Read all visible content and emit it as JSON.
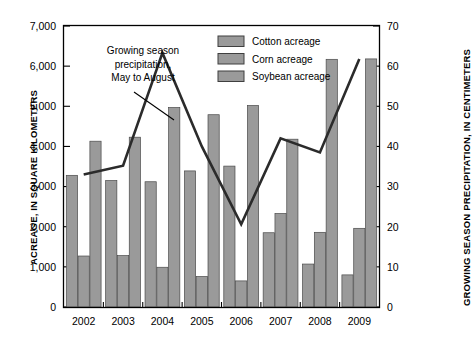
{
  "chart_data": {
    "type": "bar",
    "title": "",
    "categories": [
      "2002",
      "2003",
      "2004",
      "2005",
      "2006",
      "2007",
      "2008",
      "2009"
    ],
    "xlabel": "",
    "ylabel": "ACREAGE, IN SQUARE KILOMETERS",
    "ylabel_right": "GROWING SEASON PRECIPITATION, IN CENTIMETERS",
    "ylim": [
      0,
      7000
    ],
    "ylim_right": [
      0,
      70
    ],
    "yticks": [
      "0",
      "1,000",
      "2,000",
      "3,000",
      "4,000",
      "5,000",
      "6,000",
      "7,000"
    ],
    "yticks_right": [
      "0",
      "10",
      "20",
      "30",
      "40",
      "50",
      "60",
      "70"
    ],
    "grid": false,
    "legend_position": "top-center-right",
    "series": [
      {
        "name": "Cotton acreage",
        "type": "bar",
        "axis": "left",
        "color": "#9a9a9a",
        "values": [
          3280,
          3150,
          3120,
          3390,
          3510,
          1850,
          1070,
          800
        ]
      },
      {
        "name": "Corn acreage",
        "type": "bar",
        "axis": "left",
        "color": "#9a9a9a",
        "values": [
          1270,
          1280,
          990,
          760,
          650,
          2330,
          1860,
          1960
        ]
      },
      {
        "name": "Soybean acreage",
        "type": "bar",
        "axis": "left",
        "color": "#9a9a9a",
        "values": [
          4130,
          4230,
          4970,
          4790,
          5020,
          4180,
          6170,
          6180
        ]
      },
      {
        "name": "Growing season precipitation, May to August",
        "type": "line",
        "axis": "right",
        "color": "#2b2b2b",
        "values": [
          33.0,
          35.2,
          63.3,
          40.0,
          20.6,
          42.0,
          38.5,
          61.8
        ]
      }
    ],
    "annotations": [
      {
        "name": "precipitation-annotation",
        "lines": [
          "Growing season",
          "precipitation,",
          "May to August"
        ]
      }
    ]
  },
  "legend": {
    "items": [
      {
        "label": "Cotton acreage"
      },
      {
        "label": "Corn acreage"
      },
      {
        "label": "Soybean acreage"
      }
    ]
  }
}
